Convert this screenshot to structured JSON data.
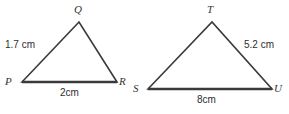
{
  "figure": {
    "background_color": "#ffffff",
    "stroke_color": "#3a3a3a",
    "text_color": "#333333",
    "triangles": [
      {
        "name": "PQR",
        "vertices": [
          {
            "label": "P",
            "x": 22,
            "y": 82,
            "label_x": 5,
            "label_y": 76
          },
          {
            "label": "Q",
            "x": 79,
            "y": 22,
            "label_x": 74,
            "label_y": 4
          },
          {
            "label": "R",
            "x": 117,
            "y": 82,
            "label_x": 119,
            "label_y": 76
          }
        ],
        "side_labels": [
          {
            "text": "1.7 cm",
            "side": "PQ",
            "x": 5,
            "y": 40
          },
          {
            "text": "2cm",
            "side": "PR",
            "x": 60,
            "y": 88
          }
        ]
      },
      {
        "name": "STU",
        "vertices": [
          {
            "label": "S",
            "x": 148,
            "y": 89,
            "label_x": 133,
            "label_y": 83
          },
          {
            "label": "T",
            "x": 212,
            "y": 22,
            "label_x": 207,
            "label_y": 4
          },
          {
            "label": "U",
            "x": 272,
            "y": 89,
            "label_x": 274,
            "label_y": 83
          }
        ],
        "side_labels": [
          {
            "text": "5.2 cm",
            "side": "TU",
            "x": 244,
            "y": 40
          },
          {
            "text": "8cm",
            "side": "SU",
            "x": 197,
            "y": 95
          }
        ]
      }
    ]
  }
}
